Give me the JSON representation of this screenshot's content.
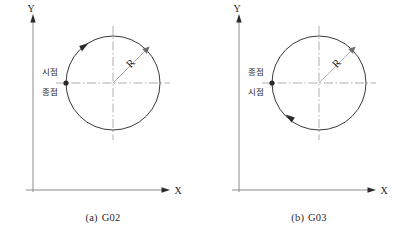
{
  "figure": {
    "background_color": "#ffffff",
    "line_color": "#3a3a3a",
    "axis_color": "#8c8c8c",
    "centerline_color": "#9a9a9a"
  },
  "panels": [
    {
      "id": "panel-a",
      "caption_index": "(a)",
      "caption_code": "G02",
      "caption_full": "(a)  G02",
      "direction": "clockwise",
      "axes": {
        "y_label": "Y",
        "x_label": "X"
      },
      "radius_label": "R",
      "point_labels": {
        "upper": "시점",
        "lower": "종점"
      },
      "upper_meaning": "start-point",
      "lower_meaning": "end-point"
    },
    {
      "id": "panel-b",
      "caption_index": "(b)",
      "caption_code": "G03",
      "caption_full": "(b)  G03",
      "direction": "counterclockwise",
      "axes": {
        "y_label": "Y",
        "x_label": "X"
      },
      "radius_label": "R",
      "point_labels": {
        "upper": "종점",
        "lower": "시점"
      },
      "upper_meaning": "end-point",
      "lower_meaning": "start-point"
    }
  ]
}
